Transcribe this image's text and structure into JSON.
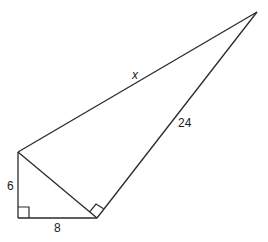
{
  "figure": {
    "type": "geometry-diagram",
    "labels": {
      "left_leg": "6",
      "bottom_leg": "8",
      "long_leg": "24",
      "hypotenuse": "x"
    },
    "vertices": {
      "top_left": [
        18,
        152
      ],
      "bottom_left": [
        18,
        218
      ],
      "bottom_right": [
        97,
        218
      ],
      "apex": [
        257,
        12
      ]
    },
    "right_angles": [
      "bottom_left",
      "bottom_right"
    ],
    "colors": {
      "stroke": "#2a2a2a",
      "text": "#1a1a1a",
      "background": "#ffffff"
    }
  }
}
